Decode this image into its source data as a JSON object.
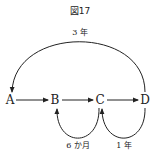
{
  "figure": {
    "title": "図17",
    "nodes": [
      {
        "id": "A",
        "label": "A"
      },
      {
        "id": "B",
        "label": "B"
      },
      {
        "id": "C",
        "label": "C"
      },
      {
        "id": "D",
        "label": "D"
      }
    ],
    "edges": [
      {
        "from": "A",
        "to": "B",
        "label": ""
      },
      {
        "from": "B",
        "to": "C",
        "label": ""
      },
      {
        "from": "C",
        "to": "D",
        "label": ""
      },
      {
        "from": "D",
        "to": "A",
        "label": "3 年"
      },
      {
        "from": "C",
        "to": "B",
        "label": "6 か月"
      },
      {
        "from": "D",
        "to": "C",
        "label": "1 年"
      }
    ],
    "labels": {
      "top_arc": "3 年",
      "loop_cb": "6 か月",
      "loop_dc": "1 年"
    },
    "colors": {
      "stroke": "#222222",
      "background": "#ffffff"
    }
  }
}
